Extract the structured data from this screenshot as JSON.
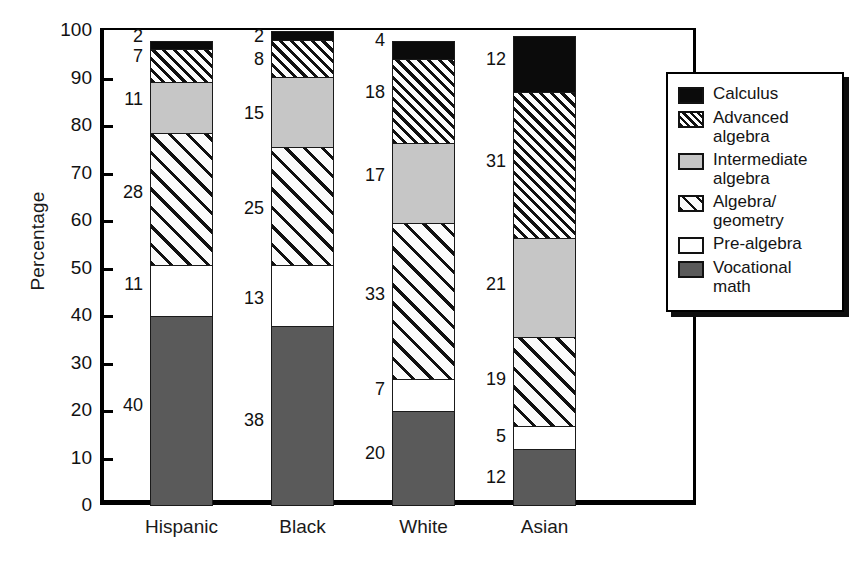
{
  "chart_data": {
    "type": "bar",
    "subtype": "stacked-bar-100",
    "title": "",
    "xlabel": "",
    "ylabel": "Percentage",
    "ylim": [
      0,
      100
    ],
    "ytick_values": [
      0,
      10,
      20,
      30,
      40,
      50,
      60,
      70,
      80,
      90,
      100
    ],
    "ytick_labels": [
      "0",
      "10",
      "20",
      "30",
      "40",
      "50",
      "60",
      "70",
      "80",
      "90",
      "100"
    ],
    "grid": false,
    "legend_position": "right",
    "categories": [
      "Hispanic",
      "Black",
      "White",
      "Asian"
    ],
    "series": [
      {
        "name": "Vocational math",
        "key": "vocational",
        "swatch": "solid-dark-gray",
        "color": "#5a5a5a",
        "values": [
          40,
          38,
          20,
          12
        ]
      },
      {
        "name": "Pre-algebra",
        "key": "prealgebra",
        "swatch": "solid-white",
        "color": "#ffffff",
        "values": [
          11,
          13,
          7,
          5
        ]
      },
      {
        "name": "Algebra/\ngeometry",
        "key": "algebrageom",
        "swatch": "wide-diagonal",
        "color": "#ffffff",
        "values": [
          28,
          25,
          33,
          19
        ]
      },
      {
        "name": "Intermediate\nalgebra",
        "key": "intermediate",
        "swatch": "solid-light-gray",
        "color": "#c6c6c6",
        "values": [
          11,
          15,
          17,
          21
        ]
      },
      {
        "name": "Advanced\nalgebra",
        "key": "advanced",
        "swatch": "dense-diagonal",
        "color": "#ffffff",
        "values": [
          7,
          8,
          18,
          31
        ]
      },
      {
        "name": "Calculus",
        "key": "calculus",
        "swatch": "solid-black",
        "color": "#0b0b0b",
        "values": [
          2,
          2,
          4,
          12
        ]
      }
    ]
  },
  "axis": {
    "y_title": "Percentage",
    "ticks": [
      {
        "label": "100",
        "value": 100
      },
      {
        "label": "90",
        "value": 90
      },
      {
        "label": "80",
        "value": 80
      },
      {
        "label": "70",
        "value": 70
      },
      {
        "label": "60",
        "value": 60
      },
      {
        "label": "50",
        "value": 50
      },
      {
        "label": "40",
        "value": 40
      },
      {
        "label": "30",
        "value": 30
      },
      {
        "label": "20",
        "value": 20
      },
      {
        "label": "10",
        "value": 10
      },
      {
        "label": "0",
        "value": 0
      }
    ]
  },
  "x_categories": [
    {
      "label": "Hispanic"
    },
    {
      "label": "Black"
    },
    {
      "label": "White"
    },
    {
      "label": "Asian"
    }
  ],
  "bars": [
    {
      "category": "Hispanic",
      "segments": [
        {
          "key": "calculus",
          "value": 2,
          "label": "2"
        },
        {
          "key": "advanced",
          "value": 7,
          "label": "7"
        },
        {
          "key": "intermediate",
          "value": 11,
          "label": "11"
        },
        {
          "key": "algebrageom",
          "value": 28,
          "label": "28"
        },
        {
          "key": "prealgebra",
          "value": 11,
          "label": "11"
        },
        {
          "key": "vocational",
          "value": 40,
          "label": "40"
        }
      ]
    },
    {
      "category": "Black",
      "segments": [
        {
          "key": "calculus",
          "value": 2,
          "label": "2"
        },
        {
          "key": "advanced",
          "value": 8,
          "label": "8"
        },
        {
          "key": "intermediate",
          "value": 15,
          "label": "15"
        },
        {
          "key": "algebrageom",
          "value": 25,
          "label": "25"
        },
        {
          "key": "prealgebra",
          "value": 13,
          "label": "13"
        },
        {
          "key": "vocational",
          "value": 38,
          "label": "38"
        }
      ]
    },
    {
      "category": "White",
      "segments": [
        {
          "key": "calculus",
          "value": 4,
          "label": "4"
        },
        {
          "key": "advanced",
          "value": 18,
          "label": "18"
        },
        {
          "key": "intermediate",
          "value": 17,
          "label": "17"
        },
        {
          "key": "algebrageom",
          "value": 33,
          "label": "33"
        },
        {
          "key": "prealgebra",
          "value": 7,
          "label": "7"
        },
        {
          "key": "vocational",
          "value": 20,
          "label": "20"
        }
      ]
    },
    {
      "category": "Asian",
      "segments": [
        {
          "key": "calculus",
          "value": 12,
          "label": "12"
        },
        {
          "key": "advanced",
          "value": 31,
          "label": "31"
        },
        {
          "key": "intermediate",
          "value": 21,
          "label": "21"
        },
        {
          "key": "algebrageom",
          "value": 19,
          "label": "19"
        },
        {
          "key": "prealgebra",
          "value": 5,
          "label": "5"
        },
        {
          "key": "vocational",
          "value": 12,
          "label": "12"
        }
      ]
    }
  ],
  "legend": {
    "items": [
      {
        "label": "Calculus",
        "key": "calculus"
      },
      {
        "label": "Advanced\nalgebra",
        "key": "advanced"
      },
      {
        "label": "Intermediate\nalgebra",
        "key": "intermediate"
      },
      {
        "label": "Algebra/\ngeometry",
        "key": "algebrageom"
      },
      {
        "label": "Pre-algebra",
        "key": "prealgebra"
      },
      {
        "label": "Vocational\nmath",
        "key": "vocational"
      }
    ]
  },
  "colors": {
    "vocational": "#5a5a5a",
    "prealgebra": "#ffffff",
    "intermediate": "#c6c6c6",
    "calculus": "#0b0b0b",
    "axis": "#000000"
  }
}
